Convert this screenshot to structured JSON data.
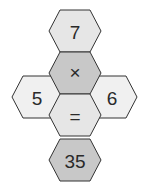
{
  "puzzle": {
    "top": {
      "label": "7",
      "color": "#e6e6e6"
    },
    "operator": {
      "label": "×",
      "color": "#c8c8c8"
    },
    "left": {
      "label": "5",
      "color": "#f0f0f0"
    },
    "right": {
      "label": "6",
      "color": "#f0f0f0"
    },
    "equals": {
      "label": "=",
      "color": "#e6e6e6"
    },
    "result": {
      "label": "35",
      "color": "#c8c8c8"
    },
    "stroke": "#333333"
  }
}
